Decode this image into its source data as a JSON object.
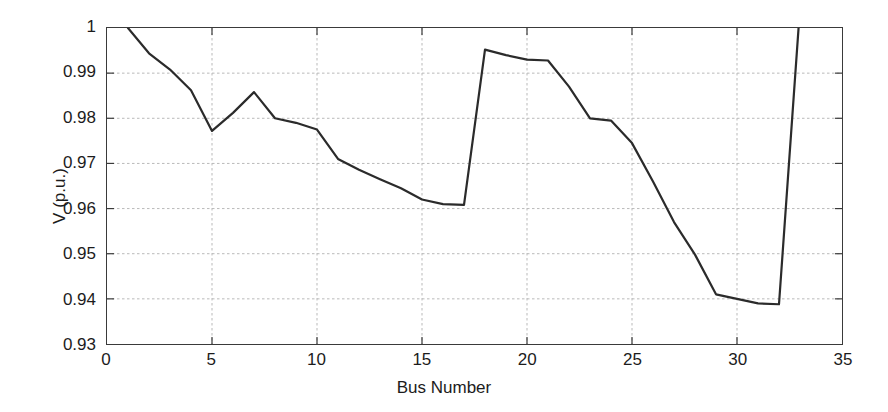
{
  "chart_data": {
    "type": "line",
    "title": "",
    "xlabel": "Bus Number",
    "ylabel": "V (p.u.)",
    "xlim": [
      0,
      35
    ],
    "ylim": [
      0.93,
      1
    ],
    "xticks": [
      "0",
      "5",
      "10",
      "15",
      "20",
      "25",
      "30",
      "35"
    ],
    "xtick_values": [
      0,
      5,
      10,
      15,
      20,
      25,
      30,
      35
    ],
    "yticks": [
      "0.93",
      "0.94",
      "0.95",
      "0.96",
      "0.97",
      "0.98",
      "0.99",
      "1"
    ],
    "ytick_values": [
      0.93,
      0.94,
      0.95,
      0.96,
      0.97,
      0.98,
      0.99,
      1
    ],
    "grid": true,
    "legend": null,
    "line_color": "#2b2b2b",
    "line_width": 2.2,
    "x": [
      1,
      2,
      3,
      4,
      5,
      6,
      7,
      8,
      9,
      10,
      11,
      12,
      13,
      14,
      15,
      16,
      17,
      18,
      19,
      20,
      21,
      22,
      23,
      24,
      25,
      26,
      27,
      28,
      29,
      30,
      31,
      32,
      33
    ],
    "values": [
      1.0,
      0.9944,
      0.9908,
      0.9862,
      0.9772,
      0.9812,
      0.9858,
      0.98,
      0.979,
      0.9775,
      0.971,
      0.9686,
      0.9665,
      0.9645,
      0.962,
      0.961,
      0.9608,
      0.9952,
      0.994,
      0.993,
      0.9928,
      0.987,
      0.98,
      0.9795,
      0.9745,
      0.966,
      0.957,
      0.9498,
      0.941,
      0.94,
      0.939,
      0.9388,
      1.0045
    ],
    "series_name": "Voltage magnitude"
  },
  "axes": {
    "frame_color": "#3a3a3a",
    "grid_color": "#b9b9b9",
    "background": "#ffffff"
  }
}
